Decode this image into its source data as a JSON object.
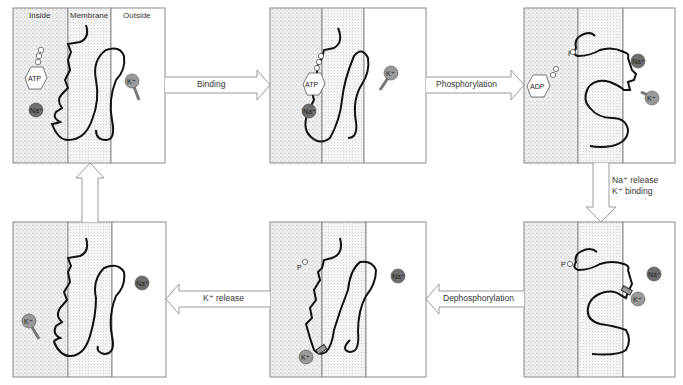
{
  "headers": {
    "inside": "Inside",
    "membrane": "Membrane",
    "outside": "Outside"
  },
  "steps": {
    "binding": "Binding",
    "phosphorylation": "Phosphorylation",
    "na_release": "Na⁺ release",
    "k_binding": "K⁺ binding",
    "dephosphorylation": "Dephosphorylation",
    "k_release": "K⁺ release"
  },
  "molecules": {
    "atp": "ATP",
    "adp": "ADP",
    "phosphate": "P",
    "sodium": "Na⁺",
    "potassium": "K⁺"
  },
  "colors": {
    "inside_fill": "#e6e6e6",
    "membrane_fill": "#ececec",
    "outline": "#8a8a8a",
    "protein": "#111111",
    "sodium_ion": "#6e6e6e",
    "potassium_ion": "#9a9a9a"
  }
}
